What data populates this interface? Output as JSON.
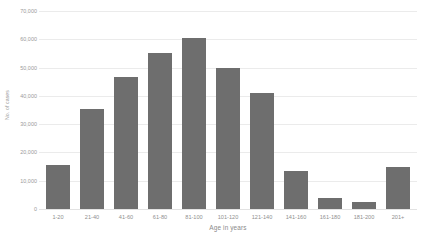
{
  "chart_data": {
    "type": "bar",
    "title": "",
    "xlabel": "Age in years",
    "ylabel": "No. of cases",
    "categories": [
      "1-20",
      "21-40",
      "41-60",
      "61-80",
      "81-100",
      "101-120",
      "121-140",
      "141-160",
      "161-180",
      "181-200",
      "201+"
    ],
    "values": [
      15500,
      35500,
      46500,
      55000,
      60500,
      50000,
      41000,
      13500,
      4000,
      2500,
      15000
    ],
    "ylim": [
      0,
      70000
    ],
    "yticks": [
      0,
      10000,
      20000,
      30000,
      40000,
      50000,
      60000,
      70000
    ],
    "ytick_labels": [
      "0",
      "10,000",
      "20,000",
      "30,000",
      "40,000",
      "50,000",
      "60,000",
      "70,000"
    ],
    "grid": true,
    "legend": false,
    "bar_color": "#6e6e6e",
    "gridline_color": "#ebebeb",
    "background_color": "#ffffff",
    "axis_text_color": "#8f8f8f"
  }
}
